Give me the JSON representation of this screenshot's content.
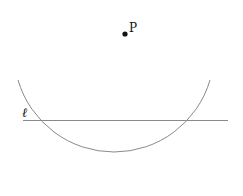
{
  "figure": {
    "point": {
      "label": "P",
      "x": 125,
      "y": 34
    },
    "line": {
      "label": "ℓ",
      "x1": 23,
      "y1": 120.5,
      "x2": 228,
      "y2": 120.5
    },
    "arc": {
      "cx": 114,
      "cy": 51,
      "r": 100,
      "start": [
        18,
        80
      ],
      "end": [
        210,
        80
      ]
    },
    "colors": {
      "stroke": "#8a8a8a",
      "point": "#111111",
      "background": "#ffffff"
    }
  }
}
